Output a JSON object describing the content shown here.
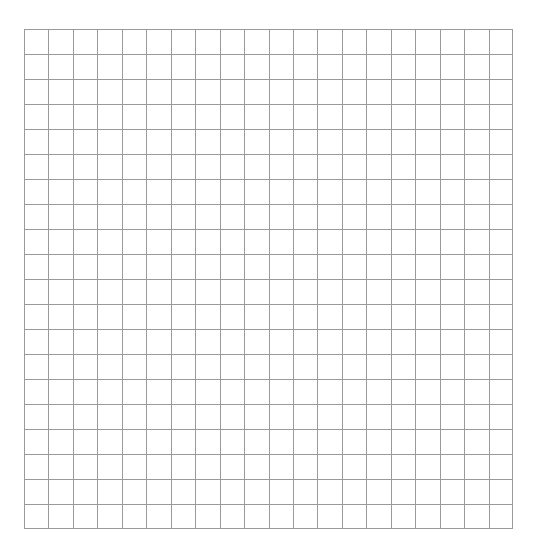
{
  "grid": {
    "columns": 20,
    "rows": 20,
    "line_color": "#9a9a9a",
    "background_color": "#ffffff",
    "origin": {
      "x": 24,
      "y": 29
    },
    "width": 489,
    "height": 500
  }
}
